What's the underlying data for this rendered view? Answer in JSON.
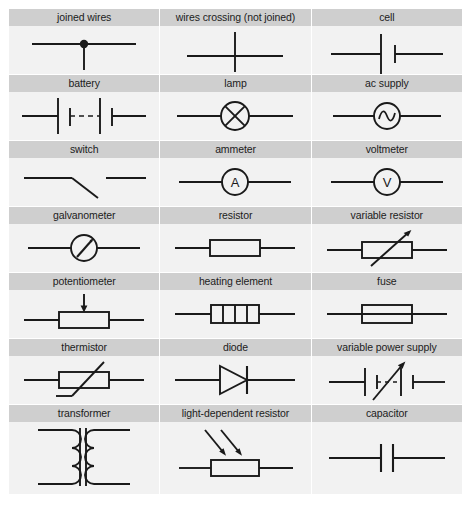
{
  "grid": {
    "columns": 3,
    "rows": 7
  },
  "colors": {
    "label_band": "#cfcfcf",
    "symbol_background": "#f2f2f2",
    "page_background": "#ffffff",
    "stroke": "#1a1a1a",
    "label_text": "#1c1c1c"
  },
  "cells": [
    {
      "label": "joined wires",
      "icon": "joined-wires-symbol"
    },
    {
      "label": "wires crossing (not joined)",
      "icon": "wires-crossing-symbol"
    },
    {
      "label": "cell",
      "icon": "cell-symbol"
    },
    {
      "label": "battery",
      "icon": "battery-symbol"
    },
    {
      "label": "lamp",
      "icon": "lamp-symbol"
    },
    {
      "label": "ac supply",
      "icon": "ac-supply-symbol"
    },
    {
      "label": "switch",
      "icon": "switch-symbol"
    },
    {
      "label": "ammeter",
      "icon": "ammeter-symbol"
    },
    {
      "label": "voltmeter",
      "icon": "voltmeter-symbol"
    },
    {
      "label": "galvanometer",
      "icon": "galvanometer-symbol"
    },
    {
      "label": "resistor",
      "icon": "resistor-symbol"
    },
    {
      "label": "variable resistor",
      "icon": "variable-resistor-symbol"
    },
    {
      "label": "potentiometer",
      "icon": "potentiometer-symbol"
    },
    {
      "label": "heating element",
      "icon": "heating-element-symbol"
    },
    {
      "label": "fuse",
      "icon": "fuse-symbol"
    },
    {
      "label": "thermistor",
      "icon": "thermistor-symbol"
    },
    {
      "label": "diode",
      "icon": "diode-symbol"
    },
    {
      "label": "variable power supply",
      "icon": "variable-power-supply-symbol"
    },
    {
      "label": "transformer",
      "icon": "transformer-symbol"
    },
    {
      "label": "light-dependent resistor",
      "icon": "ldr-symbol"
    },
    {
      "label": "capacitor",
      "icon": "capacitor-symbol"
    }
  ],
  "symbol_letters": {
    "ammeter": "A",
    "voltmeter": "V"
  }
}
